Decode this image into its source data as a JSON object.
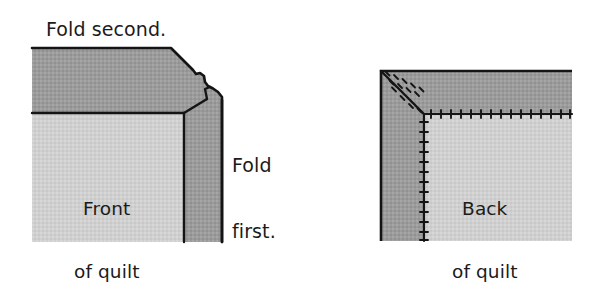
{
  "figure": {
    "type": "instructional-diagram",
    "background_color": "#ffffff",
    "colors": {
      "binding_dark_gray": "#9b9b9b",
      "quilt_light_gray": "#d0d0d0",
      "outline_black": "#141414",
      "text_black": "#1b1b1b"
    },
    "panels": [
      {
        "id": "left-panel",
        "name": "front-of-quilt-panel",
        "inner_label_line1": "Front",
        "inner_label_line2": "of quilt",
        "callouts": [
          {
            "name": "fold-second-callout",
            "text": "Fold second."
          },
          {
            "name": "fold-first-callout",
            "line1": "Fold",
            "line2": "first."
          }
        ]
      },
      {
        "id": "right-panel",
        "name": "back-of-quilt-panel",
        "inner_label_line1": "Back",
        "inner_label_line2": "of quilt",
        "stitching": {
          "miter_seam": "diagonal stitched miter",
          "horizontal_seam": "stitched binding edge",
          "vertical_seam": "stitched binding edge"
        }
      }
    ]
  },
  "labels": {
    "fold_second": "Fold second.",
    "fold_first_line1": "Fold",
    "fold_first_line2": "first.",
    "front_of_quilt_line1": "Front",
    "front_of_quilt_line2": "of quilt",
    "back_of_quilt_line1": "Back",
    "back_of_quilt_line2": "of quilt"
  }
}
